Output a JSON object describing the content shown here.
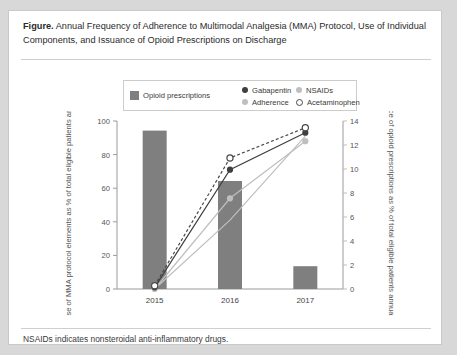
{
  "figure": {
    "label": "Figure.",
    "caption": "Annual Frequency of Adherence to Multimodal Analgesia (MMA) Protocol, Use of Individual Components, and Issuance of Opioid Prescriptions on Discharge",
    "footnote": "NSAIDs indicates nonsteroidal anti-inflammatory drugs."
  },
  "legend": {
    "items": [
      {
        "label": "Opioid prescriptions",
        "marker": "bar-swatch",
        "color": "#7f7f7f"
      },
      {
        "label": "Gabapentin",
        "marker": "filled-dark-circle",
        "color": "#3f3f3f"
      },
      {
        "label": "NSAIDs",
        "marker": "filled-light-circle",
        "color": "#bfbfbf"
      },
      {
        "label": "Adherence",
        "marker": "filled-light-circle",
        "color": "#bfbfbf"
      },
      {
        "label": "Acetaminophen",
        "marker": "open-circle",
        "color": "#4a4a4a"
      }
    ]
  },
  "chart_data": {
    "type": "bar",
    "title": "Annual Frequency of Adherence to Multimodal Analgesia (MMA) Protocol, Use of Individual Components, and Issuance of Opioid Prescriptions on Discharge",
    "categories": [
      "2015",
      "2016",
      "2017"
    ],
    "xlabel": "Year of surgery",
    "ylabel": "Use of MMA protocol elements as % of total eligible patients annually",
    "ylabel_right": "Issuance of opioid prescriptions as % of total eligible patients annually",
    "ylim": [
      0,
      100
    ],
    "yticks": [
      0,
      20,
      40,
      60,
      80,
      100
    ],
    "ylim_right": [
      0,
      14
    ],
    "yticks_right": [
      0,
      2,
      4,
      6,
      8,
      10,
      12,
      14
    ],
    "grid": false,
    "legend_position": "top",
    "series": [
      {
        "name": "Opioid prescriptions",
        "type": "bar",
        "axis": "right",
        "color": "#7f7f7f",
        "values": [
          13.2,
          9.0,
          1.9
        ]
      },
      {
        "name": "Gabapentin",
        "type": "line",
        "axis": "left",
        "color": "#3f3f3f",
        "line_style": "solid",
        "marker": "filled-circle",
        "values": [
          1,
          71,
          93
        ]
      },
      {
        "name": "Acetaminophen",
        "type": "line",
        "axis": "left",
        "color": "#4a4a4a",
        "line_style": "dashed",
        "marker": "open-circle",
        "values": [
          2,
          78,
          96
        ]
      },
      {
        "name": "Adherence",
        "type": "line",
        "axis": "left",
        "color": "#bfbfbf",
        "line_style": "solid",
        "marker": "filled-circle",
        "values": [
          0,
          54,
          88
        ]
      },
      {
        "name": "NSAIDs",
        "type": "line",
        "axis": "left",
        "color": "#bfbfbf",
        "line_style": "solid",
        "marker": "none",
        "values": [
          0,
          41,
          91
        ]
      }
    ]
  }
}
